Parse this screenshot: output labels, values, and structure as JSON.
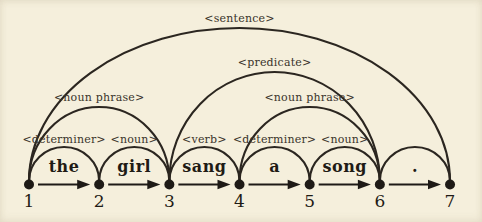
{
  "diagram": {
    "colors": {
      "background": "#f5efdc",
      "arc_ink": "#2b2620",
      "word_ink": "#1f1b15",
      "label_ink": "#3a342b",
      "node_ink": "#1e1a16"
    },
    "nodes": [
      {
        "id": "1"
      },
      {
        "id": "2"
      },
      {
        "id": "3"
      },
      {
        "id": "4"
      },
      {
        "id": "5"
      },
      {
        "id": "6"
      },
      {
        "id": "7"
      }
    ],
    "words": [
      {
        "text": "the",
        "from": 1,
        "to": 2
      },
      {
        "text": "girl",
        "from": 2,
        "to": 3
      },
      {
        "text": "sang",
        "from": 3,
        "to": 4
      },
      {
        "text": "a",
        "from": 4,
        "to": 5
      },
      {
        "text": "song",
        "from": 5,
        "to": 6
      },
      {
        "text": ".",
        "from": 6,
        "to": 7
      }
    ],
    "arcs": [
      {
        "label": "<determiner>",
        "from": 1,
        "to": 2,
        "level": 1
      },
      {
        "label": "<noun>",
        "from": 2,
        "to": 3,
        "level": 1
      },
      {
        "label": "<noun phrase>",
        "from": 1,
        "to": 3,
        "level": 2
      },
      {
        "label": "<verb>",
        "from": 3,
        "to": 4,
        "level": 1
      },
      {
        "label": "<determiner>",
        "from": 4,
        "to": 5,
        "level": 1
      },
      {
        "label": "<noun>",
        "from": 5,
        "to": 6,
        "level": 1
      },
      {
        "label": "<noun phrase>",
        "from": 4,
        "to": 6,
        "level": 2
      },
      {
        "label": "<predicate>",
        "from": 3,
        "to": 6,
        "level": 3
      },
      {
        "label": "",
        "from": 6,
        "to": 7,
        "level": 1
      },
      {
        "label": "<sentence>",
        "from": 1,
        "to": 7,
        "level": 4
      }
    ]
  }
}
